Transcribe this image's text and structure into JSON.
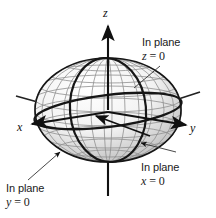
{
  "figure": {
    "background_color": "#ffffff",
    "line_color": "#222222",
    "mesh_color": "#9a9a9a",
    "shade_color": "#c8c8c8"
  },
  "axes": {
    "x": {
      "label": "x",
      "direction": "left"
    },
    "y": {
      "label": "y",
      "direction": "right"
    },
    "z": {
      "label": "z",
      "direction": "up"
    }
  },
  "callouts": [
    {
      "id": "plane-z",
      "text": "In plane",
      "equation_var": "z",
      "equation_op": " = ",
      "equation_val": "0",
      "position": "top-right"
    },
    {
      "id": "plane-x",
      "text": "In plane",
      "equation_var": "x",
      "equation_op": " = ",
      "equation_val": "0",
      "position": "bottom-right"
    },
    {
      "id": "plane-y",
      "text": "In plane",
      "equation_var": "y",
      "equation_op": " = ",
      "equation_val": "0",
      "position": "bottom-left"
    }
  ]
}
